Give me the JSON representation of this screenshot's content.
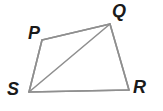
{
  "figure": {
    "kind": "geometry-diagram",
    "shape": "quadrilateral-with-diagonal",
    "width": 163,
    "height": 111,
    "background_color": "#ffffff",
    "stroke_color": "#8f8f8f",
    "stroke_width": 1.6,
    "label_color": "#1a1a1a",
    "vertices": [
      {
        "name": "P",
        "label": "P",
        "x": 42,
        "y": 40,
        "label_x": 28,
        "label_y": 24
      },
      {
        "name": "Q",
        "label": "Q",
        "x": 110,
        "y": 24,
        "label_x": 112,
        "label_y": 2
      },
      {
        "name": "R",
        "label": "R",
        "x": 129,
        "y": 90,
        "label_x": 133,
        "label_y": 78
      },
      {
        "name": "S",
        "label": "S",
        "x": 29,
        "y": 92,
        "label_x": 7,
        "label_y": 80
      }
    ],
    "edges": [
      {
        "name": "edge-PQ",
        "from": "P",
        "to": "Q",
        "path": "42,40 110,24"
      },
      {
        "name": "edge-QR",
        "from": "Q",
        "to": "R",
        "path": "110,24 129,90"
      },
      {
        "name": "edge-RS",
        "from": "R",
        "to": "S",
        "path": "129,90 29,92"
      },
      {
        "name": "edge-SP",
        "from": "S",
        "to": "P",
        "path": "29,92 42,40"
      },
      {
        "name": "diagonal-SQ",
        "from": "S",
        "to": "Q",
        "path": "29,92 110,24"
      }
    ],
    "outline_points": "42,40 110,24 129,90 29,92"
  }
}
